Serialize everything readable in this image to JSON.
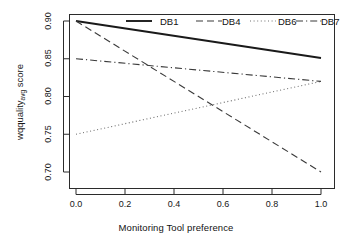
{
  "chart_data": {
    "type": "line",
    "title": "",
    "xlabel": "Monitoring Tool preference",
    "ylabel": "wqquality",
    "ylabel_sub": "avg",
    "ylabel_suffix": " score",
    "xlim": [
      0.0,
      1.0
    ],
    "ylim": [
      0.7,
      0.9
    ],
    "xticks": [
      "0.0",
      "0.2",
      "0.4",
      "0.6",
      "0.8",
      "1.0"
    ],
    "xtick_values": [
      0.0,
      0.2,
      0.4,
      0.6,
      0.8,
      1.0
    ],
    "yticks": [
      "0.70",
      "0.75",
      "0.80",
      "0.85",
      "0.90"
    ],
    "ytick_values": [
      0.7,
      0.75,
      0.8,
      0.85,
      0.9
    ],
    "grid": false,
    "legend_position": "top",
    "x": [
      0.0,
      1.0
    ],
    "series": [
      {
        "name": "DB1",
        "style": "solid",
        "color": "#1a1a1a",
        "width": 1.9,
        "values": [
          0.9,
          0.851
        ]
      },
      {
        "name": "DB4",
        "style": "dashed",
        "color": "#3a3a3a",
        "width": 1.1,
        "values": [
          0.9,
          0.7
        ]
      },
      {
        "name": "DB6",
        "style": "dotted",
        "color": "#707070",
        "width": 1.1,
        "values": [
          0.75,
          0.82
        ]
      },
      {
        "name": "DB7",
        "style": "dashdot",
        "color": "#3a3a3a",
        "width": 1.1,
        "values": [
          0.85,
          0.82
        ]
      }
    ]
  },
  "legend": {
    "entries": [
      {
        "label": "DB1"
      },
      {
        "label": "DB4"
      },
      {
        "label": "DB6"
      },
      {
        "label": "DB7"
      }
    ]
  },
  "axes": {
    "x_title": "Monitoring Tool preference",
    "y_title_main": "wqquality",
    "y_title_sub": "avg",
    "y_title_tail": " score"
  },
  "colors": {
    "background": "#ffffff",
    "frame": "#2b2b2b",
    "text": "#141414"
  }
}
